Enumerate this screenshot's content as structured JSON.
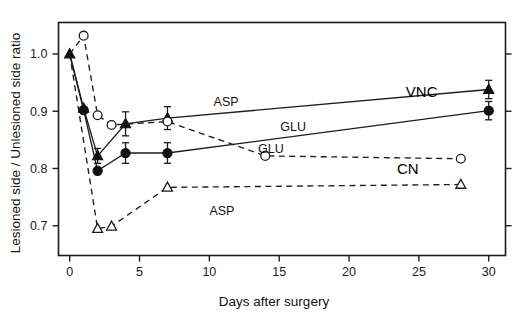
{
  "chart_data": {
    "type": "line",
    "title": "",
    "xlabel": "Days after surgery",
    "ylabel": "Lesioned side / Unlesioned side ratio",
    "xlim": [
      -0.8,
      31.2
    ],
    "ylim": [
      0.648,
      1.055
    ],
    "xticks": [
      0,
      5,
      10,
      15,
      20,
      25,
      30
    ],
    "xticklabels": [
      "0",
      "5",
      "10",
      "15",
      "20",
      "25",
      "30"
    ],
    "yticks": [
      0.7,
      0.8,
      0.9,
      1.0
    ],
    "yticklabels": [
      "0.7",
      "0.8",
      "0.9",
      "1.0"
    ],
    "grid": false,
    "legend_position": "inline-annotations",
    "series": [
      {
        "name": "VNC ASP",
        "marker": "filled-triangle",
        "linestyle": "solid",
        "x": [
          0,
          1,
          2,
          4,
          7,
          30
        ],
        "values": [
          1.0,
          0.905,
          0.822,
          0.878,
          0.888,
          0.938
        ],
        "errors": [
          0,
          0,
          0.013,
          0.021,
          0.02,
          0.016
        ]
      },
      {
        "name": "VNC GLU",
        "marker": "filled-circle",
        "linestyle": "solid",
        "x": [
          0,
          1,
          2,
          4,
          7,
          30
        ],
        "values": [
          1.0,
          0.902,
          0.796,
          0.827,
          0.827,
          0.901
        ],
        "errors": [
          0,
          0,
          0,
          0.018,
          0.018,
          0.016
        ]
      },
      {
        "name": "CN GLU",
        "marker": "open-circle",
        "linestyle": "dashed",
        "x": [
          0,
          1,
          2,
          3,
          7,
          14,
          28
        ],
        "values": [
          1.0,
          1.032,
          0.893,
          0.876,
          0.882,
          0.822,
          0.817
        ],
        "errors": [
          0,
          0,
          0,
          0,
          0,
          0,
          0
        ]
      },
      {
        "name": "CN ASP",
        "marker": "open-triangle",
        "linestyle": "dashed",
        "x": [
          0,
          2,
          3,
          7,
          28
        ],
        "values": [
          1.0,
          0.695,
          0.699,
          0.767,
          0.772
        ],
        "errors": [
          0,
          0,
          0,
          0,
          0
        ]
      }
    ],
    "annotations": [
      {
        "text": "ASP",
        "x": 11.2,
        "y": 0.9095,
        "ref": "vnc-asp"
      },
      {
        "text": "GLU",
        "x": 16.0,
        "y": 0.8655,
        "ref": "vnc-glu"
      },
      {
        "text": "GLU",
        "x": 14.4,
        "y": 0.8275,
        "ref": "cn-glu"
      },
      {
        "text": "ASP",
        "x": 10.9,
        "y": 0.7195,
        "ref": "cn-asp"
      },
      {
        "text": "VNC",
        "x": 25.2,
        "y": 0.9255,
        "ref": "group-vnc"
      },
      {
        "text": "CN",
        "x": 24.2,
        "y": 0.7905,
        "ref": "group-cn"
      }
    ]
  },
  "axes": {
    "x_title": "Days after surgery",
    "y_title": "Lesioned side / Unlesioned side ratio"
  }
}
